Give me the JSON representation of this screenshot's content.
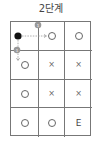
{
  "title": "2단계",
  "grid": {
    "columns": 3,
    "rows": 4,
    "cells": [
      [
        "start",
        "o",
        "o"
      ],
      [
        "o",
        "x",
        "x"
      ],
      [
        "o",
        "x",
        "x"
      ],
      [
        "o",
        "o",
        "E"
      ]
    ],
    "symbols": {
      "o": "○",
      "x": "×",
      "E": "E"
    }
  },
  "annotations": {
    "markers": [
      {
        "label": "1",
        "position": "between row1-col1 and row1-col2"
      },
      {
        "label": "1",
        "position": "between row1-col1 and row2-col1"
      }
    ],
    "arrows": [
      {
        "from": "row1-col1",
        "to": "row1-col2",
        "style": "dashed"
      },
      {
        "from": "row1-col1",
        "to": "row2-col1",
        "style": "dashed"
      }
    ]
  },
  "colors": {
    "grid_line": "#777777",
    "start_dot": "#111111",
    "marker": "#999999",
    "arrow": "#999999"
  }
}
